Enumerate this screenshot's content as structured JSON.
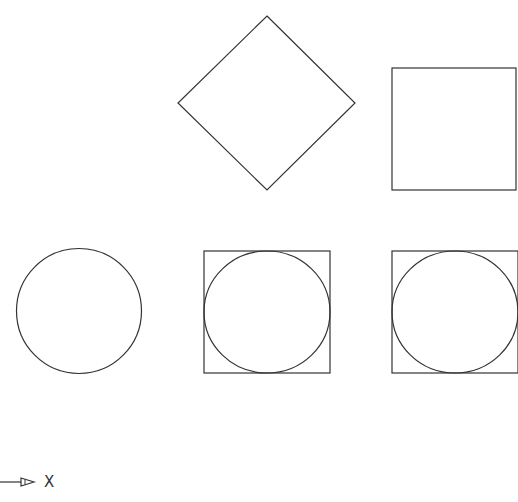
{
  "diagram": {
    "stroke_color": "#333333",
    "background": "#ffffff",
    "shapes": [
      {
        "id": "diamond",
        "type": "rotated-square",
        "points": [
          [
            267,
            16
          ],
          [
            355,
            103
          ],
          [
            267,
            190
          ],
          [
            178,
            103
          ]
        ]
      },
      {
        "id": "square-top-right",
        "type": "square",
        "x": 392,
        "y": 68,
        "w": 124,
        "h": 122
      },
      {
        "id": "circle-left",
        "type": "circle",
        "cx": 79,
        "cy": 311,
        "r": 62
      },
      {
        "id": "square-circle-middle",
        "type": "circle-in-square",
        "x": 204,
        "y": 251,
        "w": 126,
        "h": 122,
        "cx": 267,
        "cy": 312,
        "r": 62
      },
      {
        "id": "square-circle-right",
        "type": "circle-in-square",
        "x": 392,
        "y": 251,
        "w": 126,
        "h": 122,
        "cx": 455,
        "cy": 312,
        "r": 62
      }
    ],
    "axis": {
      "label": "X",
      "direction": "right"
    }
  }
}
